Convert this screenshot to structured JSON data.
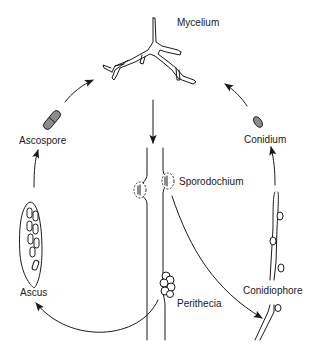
{
  "diagram": {
    "type": "life-cycle",
    "labels": {
      "mycelium": "Mycelium",
      "ascospore": "Ascospore",
      "conidium": "Conidium",
      "sporodochium": "Sporodochium",
      "ascus": "Ascus",
      "perithecia": "Perithecia",
      "conidiophore": "Conidiophore"
    },
    "arrows": [
      {
        "from": "Mycelium",
        "to": "Sporodochium / hyphae"
      },
      {
        "from": "Ascospore",
        "to": "Mycelium"
      },
      {
        "from": "Conidium",
        "to": "Mycelium"
      },
      {
        "from": "Ascus",
        "to": "Ascospore"
      },
      {
        "from": "Conidiophore",
        "to": "Conidium"
      },
      {
        "from": "Perithecia",
        "to": "Ascus"
      },
      {
        "from": "Sporodochium",
        "to": "Conidiophore"
      }
    ],
    "colors": {
      "line": "#1a1a1a",
      "spore_fill": "#8c8c8c",
      "background": "#ffffff"
    }
  }
}
